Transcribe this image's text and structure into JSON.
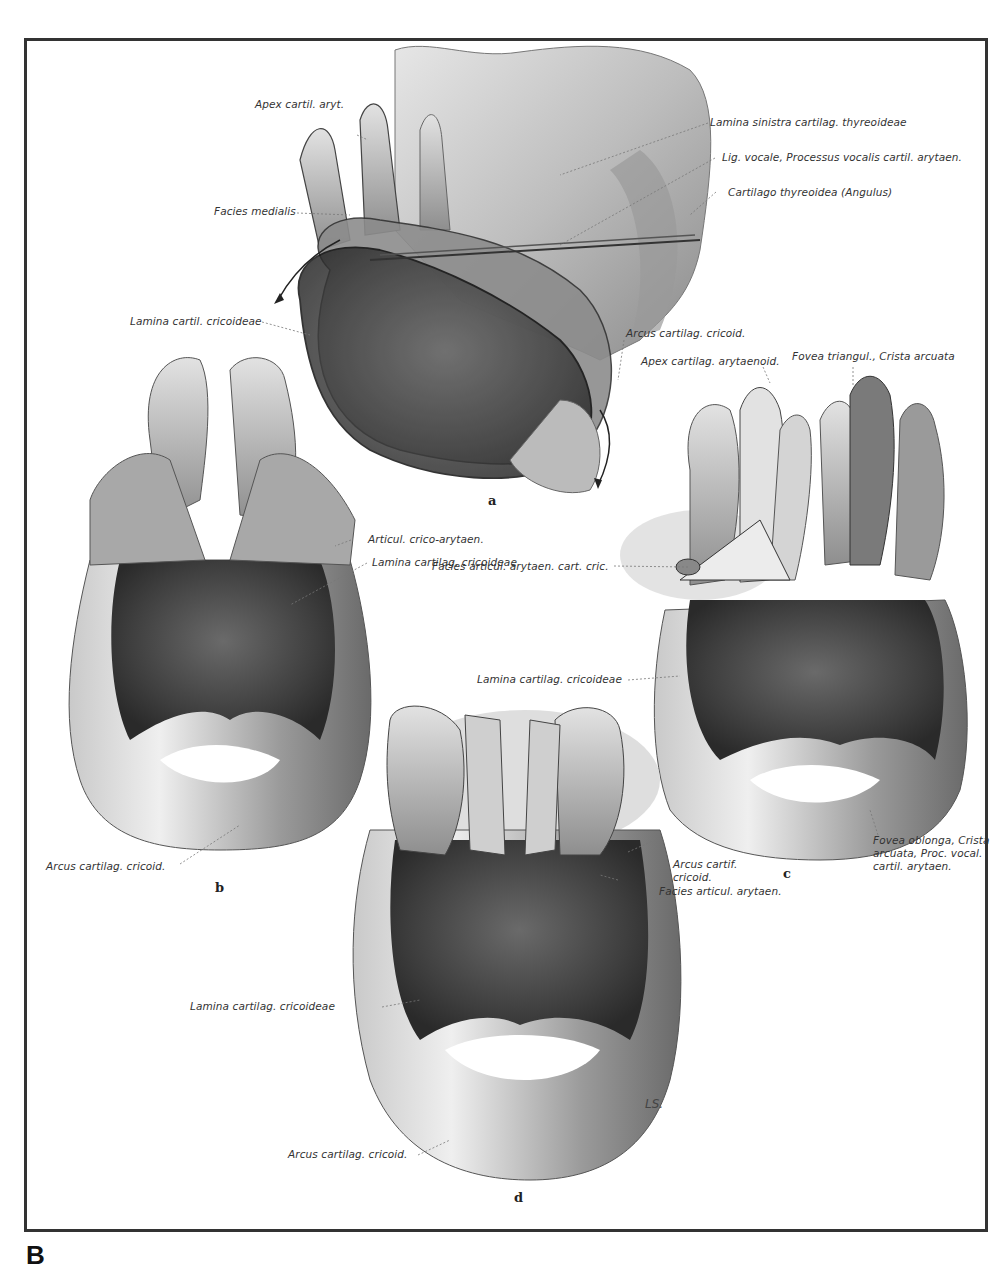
{
  "figure": {
    "panel_letter": "B",
    "signature": "LS.",
    "subfigures": [
      {
        "id": "a",
        "label": "a"
      },
      {
        "id": "b",
        "label": "b"
      },
      {
        "id": "c",
        "label": "c"
      },
      {
        "id": "d",
        "label": "d"
      }
    ],
    "labels": {
      "a": {
        "apex_cartil_aryt": "Apex cartil. aryt.",
        "facies_medialis": "Facies medialis",
        "lamina_cartil_cricoideae": "Lamina cartil. cricoideae",
        "lamina_sinistra": "Lamina sinistra cartilag. thyreoideae",
        "lig_vocale": "Lig. vocale, Processus vocalis cartil. arytaen.",
        "cartilago_thyreoidea": "Cartilago thyreoidea (Angulus)",
        "arcus_cartilag_cricoid": "Arcus cartilag. cricoid."
      },
      "b": {
        "articul_crico_arytaen": "Articul. crico-arytaen.",
        "lamina_cartilag_cricoideae": "Lamina cartilag. cricoideae",
        "arcus_cartilag_cricoid": "Arcus cartilag. cricoid."
      },
      "c": {
        "apex_cartilag_arytaenoid": "Apex cartilag. arytaenoid.",
        "fovea_triangul": "Fovea triangul., Crista arcuata",
        "facies_articul_arytaen_cart_cric": "Facies articul. arytaen. cart. cric.",
        "lamina_cartilag_cricoideae": "Lamina cartilag. cricoideae",
        "fovea_oblonga": "Fovea oblonga, Crista\narcuata, Proc. vocal.\ncartil. arytaen.",
        "arcus_cartif_cricoid": "Arcus cartif.\ncricoid."
      },
      "d": {
        "facies_articul_arytaen": "Facies articul. arytaen.",
        "lamina_cartilag_cricoideae": "Lamina cartilag. cricoideae",
        "arcus_cartilag_cricoid": "Arcus cartilag. cricoid."
      }
    }
  }
}
